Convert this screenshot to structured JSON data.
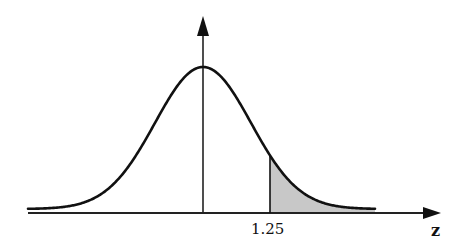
{
  "figure": {
    "x_axis_label": "z",
    "marked_value_label": "1.25",
    "marked_value": 1.25,
    "shaded_region": "right tail (z > 1.25)",
    "colors": {
      "curve": "#111111",
      "axes": "#222222",
      "shade": "#c8c8c8",
      "background": "#ffffff"
    }
  },
  "geometry": {
    "mean_x": 203,
    "baseline_y": 209,
    "axis_y": 213,
    "peak_y": 67,
    "sigma_px": 48,
    "curve_x_start": 28,
    "curve_x_end": 375,
    "axis_x_start": 28,
    "axis_x_end": 441,
    "vaxis_top": 16
  }
}
